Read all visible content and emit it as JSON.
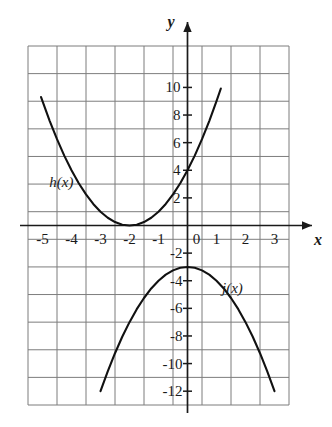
{
  "figure": {
    "background_color": "#ffffff",
    "grid_color": "#7d7d7d",
    "axis_color": "#1a1a1a",
    "curve_color": "#111111"
  },
  "axes": {
    "x_axis_label": "x",
    "y_axis_label": "y",
    "x_tick_labels": [
      "-5",
      "-4",
      "-3",
      "-2",
      "-1",
      "0",
      "1",
      "2",
      "3"
    ],
    "x_tick_values": [
      -5,
      -4,
      -3,
      -2,
      -1,
      0,
      1,
      2,
      3
    ],
    "y_tick_labels_positive": [
      "10",
      "8",
      "6",
      "4",
      "2"
    ],
    "y_tick_values_positive": [
      10,
      8,
      6,
      4,
      2
    ],
    "y_tick_labels_negative": [
      "-2",
      "-4",
      "-6",
      "-8",
      "-10",
      "-12"
    ],
    "y_tick_values_negative": [
      -2,
      -4,
      -6,
      -8,
      -10,
      -12
    ]
  },
  "curve_labels": {
    "h": "h(x)",
    "j": "j(x)"
  },
  "chart_data": {
    "type": "line",
    "xlabel": "x",
    "ylabel": "y",
    "xlim": [
      -5.5,
      3.5
    ],
    "ylim": [
      -13,
      13
    ],
    "grid": true,
    "grid_spacing_x": 1,
    "grid_spacing_y": 2,
    "legend": "inline-annotations",
    "series": [
      {
        "name": "h(x)",
        "equation": "h(x) = (x + 2)^2",
        "vertex": [
          -2,
          0
        ],
        "opens": "up",
        "domain": [
          -5.05,
          1.15
        ],
        "label_position": [
          -4.35,
          3.1
        ],
        "points": [
          [
            -5.05,
            9.3
          ],
          [
            -4.75,
            7.56
          ],
          [
            -4.5,
            6.25
          ],
          [
            -4.25,
            5.06
          ],
          [
            -4.0,
            4.0
          ],
          [
            -3.75,
            3.06
          ],
          [
            -3.5,
            2.25
          ],
          [
            -3.25,
            1.56
          ],
          [
            -3.0,
            1.0
          ],
          [
            -2.75,
            0.56
          ],
          [
            -2.5,
            0.25
          ],
          [
            -2.25,
            0.06
          ],
          [
            -2.0,
            0.0
          ],
          [
            -1.75,
            0.06
          ],
          [
            -1.5,
            0.25
          ],
          [
            -1.25,
            0.56
          ],
          [
            -1.0,
            1.0
          ],
          [
            -0.75,
            1.56
          ],
          [
            -0.5,
            2.25
          ],
          [
            -0.25,
            3.06
          ],
          [
            0.0,
            4.0
          ],
          [
            0.25,
            5.06
          ],
          [
            0.5,
            6.25
          ],
          [
            0.75,
            7.56
          ],
          [
            1.0,
            9.0
          ],
          [
            1.15,
            9.92
          ]
        ]
      },
      {
        "name": "j(x)",
        "equation": "j(x) = -x^2 - 3",
        "vertex": [
          0,
          -3
        ],
        "opens": "down",
        "domain": [
          -3.0,
          3.0
        ],
        "label_position": [
          1.55,
          -4.6
        ],
        "points": [
          [
            -3.0,
            -12.0
          ],
          [
            -2.75,
            -10.56
          ],
          [
            -2.5,
            -9.25
          ],
          [
            -2.25,
            -8.06
          ],
          [
            -2.0,
            -7.0
          ],
          [
            -1.75,
            -6.06
          ],
          [
            -1.5,
            -5.25
          ],
          [
            -1.25,
            -4.56
          ],
          [
            -1.0,
            -4.0
          ],
          [
            -0.75,
            -3.56
          ],
          [
            -0.5,
            -3.25
          ],
          [
            -0.25,
            -3.06
          ],
          [
            0.0,
            -3.0
          ],
          [
            0.25,
            -3.06
          ],
          [
            0.5,
            -3.25
          ],
          [
            0.75,
            -3.56
          ],
          [
            1.0,
            -4.0
          ],
          [
            1.25,
            -4.56
          ],
          [
            1.5,
            -5.25
          ],
          [
            1.75,
            -6.06
          ],
          [
            2.0,
            -7.0
          ],
          [
            2.25,
            -8.06
          ],
          [
            2.5,
            -9.25
          ],
          [
            2.75,
            -10.56
          ],
          [
            3.0,
            -12.0
          ]
        ]
      }
    ]
  }
}
